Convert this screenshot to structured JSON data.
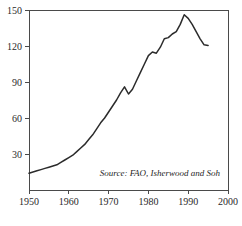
{
  "chart_data": {
    "type": "line",
    "title": "",
    "xlabel": "",
    "ylabel": "",
    "xlim": [
      1950,
      2000
    ],
    "ylim": [
      0,
      150
    ],
    "grid": false,
    "legend": null,
    "annotations": [
      {
        "name": "source-note",
        "text": "Source: FAO, Isherwood and Soh"
      }
    ],
    "xticks": [
      1950,
      1960,
      1970,
      1980,
      1990,
      2000
    ],
    "xtick_labels": [
      "1950",
      "1960",
      "1970",
      "1980",
      "1990",
      "2000"
    ],
    "yticks": [
      30,
      60,
      90,
      120,
      150
    ],
    "ytick_labels": [
      "30",
      "60",
      "90",
      "120",
      "150"
    ],
    "series": [
      {
        "name": "fertilizer-consumption",
        "color": "#2b2b2b",
        "x": [
          1950,
          1951,
          1952,
          1953,
          1954,
          1955,
          1956,
          1957,
          1958,
          1959,
          1960,
          1961,
          1962,
          1963,
          1964,
          1965,
          1966,
          1967,
          1968,
          1969,
          1970,
          1971,
          1972,
          1973,
          1974,
          1975,
          1976,
          1977,
          1978,
          1979,
          1980,
          1981,
          1982,
          1983,
          1984,
          1985,
          1986,
          1987,
          1988,
          1989,
          1990,
          1991,
          1992,
          1993,
          1994,
          1995
        ],
        "y": [
          14,
          15,
          16,
          17,
          18,
          19,
          20,
          21,
          23,
          25,
          27,
          29,
          32,
          35,
          38,
          42,
          46,
          51,
          56,
          60,
          65,
          70,
          75,
          81,
          86,
          80,
          84,
          91,
          98,
          105,
          112,
          115,
          114,
          119,
          126,
          127,
          130,
          132,
          138,
          146,
          143,
          138,
          132,
          126,
          121,
          120.5
        ],
        "marker": "none",
        "linewidth": 1.5
      }
    ]
  },
  "axes": {
    "plot_left": 29,
    "plot_right": 228,
    "plot_top": 10,
    "plot_bottom": 190
  }
}
